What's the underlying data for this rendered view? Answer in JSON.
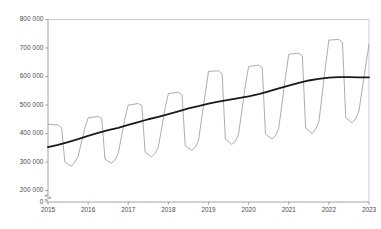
{
  "chart_data": {
    "type": "line",
    "title": "",
    "subtitle": "",
    "xlabel": "",
    "ylabel": "",
    "grid": false,
    "legend": "none",
    "axis_break": true,
    "axis_break_note": "zigzag break between 0 and 200 000 on value axis",
    "ylim": [
      200000,
      800000
    ],
    "yticks": [
      200000,
      300000,
      400000,
      500000,
      600000,
      700000,
      800000
    ],
    "ytick_labels": [
      "200 000",
      "300 000",
      "400 000",
      "500 000",
      "600 000",
      "700 000",
      "800 000"
    ],
    "y_zero_label": "0",
    "xlim": [
      2015.0,
      2023.0
    ],
    "xticks": [
      2015,
      2016,
      2017,
      2018,
      2019,
      2020,
      2021,
      2022,
      2023
    ],
    "xtick_labels": [
      "2015",
      "2016",
      "2017",
      "2018",
      "2019",
      "2020",
      "2021",
      "2022",
      "2023"
    ],
    "colors": {
      "seasonal_line": "#8a8a8a",
      "trend_line": "#1a1a1a",
      "axis": "#8a8a8a",
      "tick_text": "#4a4a4a",
      "background": "#ffffff"
    },
    "series": [
      {
        "name": "Monthly series (seasonal)",
        "color": "#8a8a8a",
        "width": 0.7,
        "x": [
          2015.0,
          2015.25,
          2015.34,
          2015.42,
          2015.58,
          2015.67,
          2015.75,
          2015.92,
          2016.0,
          2016.25,
          2016.34,
          2016.42,
          2016.58,
          2016.67,
          2016.75,
          2016.92,
          2017.0,
          2017.25,
          2017.34,
          2017.42,
          2017.58,
          2017.67,
          2017.75,
          2017.92,
          2018.0,
          2018.25,
          2018.34,
          2018.42,
          2018.58,
          2018.67,
          2018.75,
          2018.92,
          2019.0,
          2019.25,
          2019.34,
          2019.42,
          2019.58,
          2019.67,
          2019.75,
          2019.92,
          2020.0,
          2020.25,
          2020.34,
          2020.42,
          2020.58,
          2020.67,
          2020.75,
          2020.92,
          2021.0,
          2021.25,
          2021.34,
          2021.42,
          2021.58,
          2021.67,
          2021.75,
          2021.92,
          2022.0,
          2022.25,
          2022.34,
          2022.42,
          2022.58,
          2022.67,
          2022.75,
          2022.92,
          2023.0
        ],
        "y": [
          432000,
          430000,
          420000,
          300000,
          285000,
          300000,
          320000,
          420000,
          455000,
          460000,
          452000,
          310000,
          295000,
          308000,
          330000,
          455000,
          500000,
          505000,
          498000,
          335000,
          318000,
          330000,
          352000,
          490000,
          540000,
          545000,
          535000,
          358000,
          340000,
          352000,
          375000,
          540000,
          618000,
          620000,
          610000,
          380000,
          362000,
          372000,
          398000,
          570000,
          635000,
          640000,
          630000,
          398000,
          380000,
          392000,
          418000,
          600000,
          678000,
          682000,
          672000,
          420000,
          400000,
          415000,
          440000,
          640000,
          728000,
          730000,
          718000,
          455000,
          438000,
          452000,
          480000,
          640000,
          712000
        ]
      },
      {
        "name": "Trend (smoothed)",
        "color": "#1a1a1a",
        "width": 1.8,
        "x": [
          2015.0,
          2015.25,
          2015.5,
          2015.75,
          2016.0,
          2016.25,
          2016.5,
          2016.75,
          2017.0,
          2017.25,
          2017.5,
          2017.75,
          2018.0,
          2018.25,
          2018.5,
          2018.75,
          2019.0,
          2019.25,
          2019.5,
          2019.75,
          2020.0,
          2020.25,
          2020.5,
          2020.75,
          2021.0,
          2021.25,
          2021.5,
          2021.75,
          2022.0,
          2022.25,
          2022.5,
          2022.75,
          2023.0
        ],
        "y": [
          352000,
          360000,
          370000,
          380000,
          392000,
          402000,
          412000,
          420000,
          430000,
          440000,
          450000,
          458000,
          468000,
          478000,
          488000,
          496000,
          505000,
          512000,
          518000,
          524000,
          530000,
          538000,
          548000,
          558000,
          568000,
          578000,
          586000,
          592000,
          596000,
          598000,
          598000,
          597000,
          597000
        ]
      }
    ]
  }
}
